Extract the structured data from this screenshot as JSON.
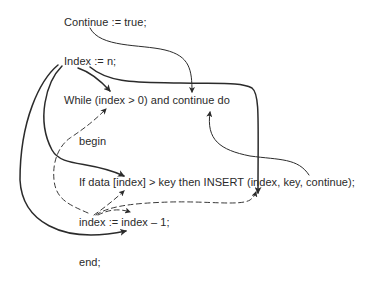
{
  "diagram": {
    "type": "data-flow annotated pseudocode",
    "lines": [
      {
        "id": "continue-init",
        "text": "Continue := true;"
      },
      {
        "id": "index-init",
        "text": "Index := n;"
      },
      {
        "id": "while-loop",
        "text": "While (index > 0) and continue do"
      },
      {
        "id": "begin",
        "text": "begin"
      },
      {
        "id": "if-insert",
        "text": "If data [index] > key then INSERT (index, key, continue);"
      },
      {
        "id": "index-decrement",
        "text": "index := index – 1;"
      },
      {
        "id": "end",
        "text": "end;"
      }
    ],
    "edges": [
      {
        "from": "Continue := true",
        "to": "continue (in While)",
        "style": "solid-thin"
      },
      {
        "from": "Index := n",
        "to": "index (in While)",
        "style": "solid"
      },
      {
        "from": "Index := n",
        "to": "index (in INSERT args)",
        "style": "solid"
      },
      {
        "from": "Index := n",
        "to": "index (in data [index])",
        "style": "solid"
      },
      {
        "from": "Index := n",
        "to": "index (in index - 1)",
        "style": "solid"
      },
      {
        "from": "continue (INSERT arg)",
        "to": "continue (in While)",
        "style": "solid-thin"
      },
      {
        "from": "index := (decrement)",
        "to": "index (in While)",
        "style": "dashed"
      },
      {
        "from": "index := (decrement)",
        "to": "index (in data [index])",
        "style": "dashed"
      },
      {
        "from": "index := (decrement)",
        "to": "index (in INSERT args)",
        "style": "dashed"
      },
      {
        "from": "index := (decrement)",
        "to": "index (in index - 1)",
        "style": "dashed"
      }
    ],
    "legend": {
      "solid": "definition from initialization",
      "dashed": "definition from loop decrement"
    }
  }
}
